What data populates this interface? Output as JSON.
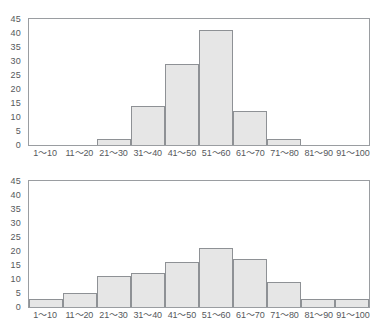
{
  "chart_data": [
    {
      "type": "bar",
      "title": "",
      "xlabel": "",
      "ylabel": "",
      "categories": [
        "1～10",
        "11～20",
        "21～30",
        "31～40",
        "41～50",
        "51～60",
        "61～70",
        "71～80",
        "81～90",
        "91～100"
      ],
      "values": [
        0,
        0,
        2,
        14,
        29,
        41,
        12,
        2,
        0,
        0
      ],
      "ylim": [
        0,
        45
      ],
      "yticks": [
        0,
        5,
        10,
        15,
        20,
        25,
        30,
        35,
        40,
        45
      ],
      "grid": false,
      "legend": "none",
      "bar_fill": "#e6e6e6",
      "bar_edge": "#8e9195",
      "frame_color": "#9a9da1"
    },
    {
      "type": "bar",
      "title": "",
      "xlabel": "",
      "ylabel": "",
      "categories": [
        "1～10",
        "11～20",
        "21～30",
        "31～40",
        "41～50",
        "51～60",
        "61～70",
        "71～80",
        "81～90",
        "91～100"
      ],
      "values": [
        3,
        5,
        11,
        12,
        16,
        21,
        17,
        9,
        3,
        3
      ],
      "ylim": [
        0,
        45
      ],
      "yticks": [
        0,
        5,
        10,
        15,
        20,
        25,
        30,
        35,
        40,
        45
      ],
      "grid": false,
      "legend": "none",
      "bar_fill": "#e6e6e6",
      "bar_edge": "#8e9195",
      "frame_color": "#9a9da1"
    }
  ]
}
